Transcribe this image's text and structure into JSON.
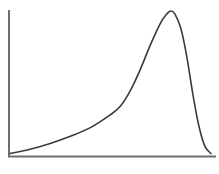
{
  "chart_data": {
    "type": "line",
    "title": "",
    "xlabel": "",
    "ylabel": "",
    "xlim": [
      0,
      1
    ],
    "ylim": [
      0,
      1
    ],
    "grid": false,
    "legend": "none",
    "series": [
      {
        "name": "left-skewed distribution",
        "x": [
          0.0,
          0.1,
          0.2,
          0.3,
          0.4,
          0.5,
          0.55,
          0.6,
          0.65,
          0.7,
          0.75,
          0.78,
          0.8,
          0.82,
          0.85,
          0.88,
          0.91,
          0.94,
          0.97,
          1.0
        ],
        "y": [
          0.01,
          0.04,
          0.08,
          0.13,
          0.19,
          0.28,
          0.34,
          0.45,
          0.6,
          0.77,
          0.92,
          0.98,
          1.0,
          0.98,
          0.88,
          0.68,
          0.42,
          0.2,
          0.06,
          0.01
        ]
      }
    ]
  }
}
